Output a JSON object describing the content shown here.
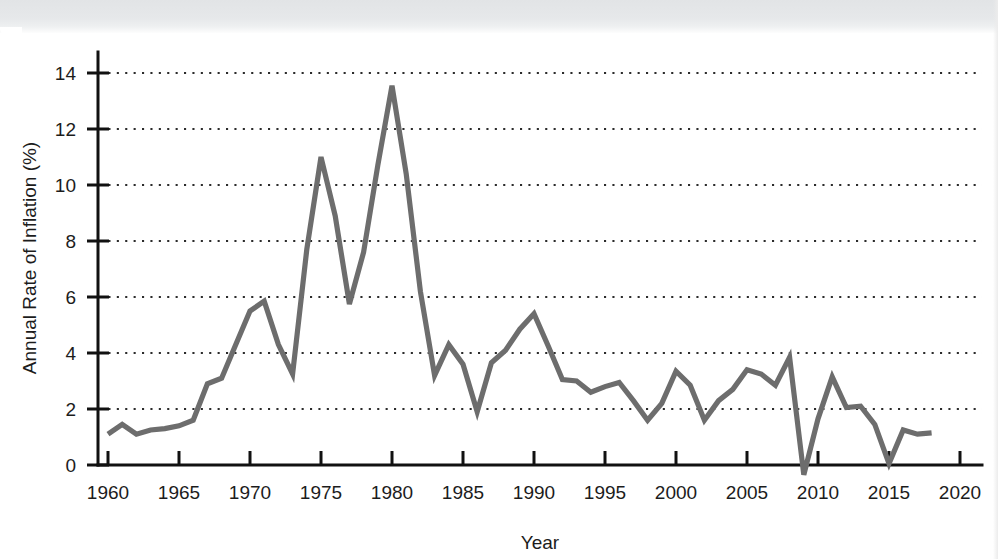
{
  "figure": {
    "background_color": "#ffffff",
    "line_color": "#6d6d6d",
    "axis_color": "#111111",
    "gridline_color": "#2b2b2b"
  },
  "axes": {
    "x_axis_title": "Year",
    "y_axis_title": "Annual Rate of Inflation (%)",
    "x_tick_labels": [
      "1960",
      "1965",
      "1970",
      "1975",
      "1980",
      "1985",
      "1990",
      "1995",
      "2000",
      "2005",
      "2010",
      "2015",
      "2020"
    ],
    "y_tick_labels": [
      "0",
      "2",
      "4",
      "6",
      "8",
      "10",
      "12",
      "14"
    ]
  },
  "chart_data": {
    "type": "line",
    "title": "",
    "subtitle": "",
    "xlabel": "Year",
    "ylabel": "Annual Rate of Inflation (%)",
    "xlim": [
      1958.5,
      2021
    ],
    "ylim": [
      -0.6,
      14.9
    ],
    "x_ticks": [
      1960,
      1965,
      1970,
      1975,
      1980,
      1985,
      1990,
      1995,
      2000,
      2005,
      2010,
      2015,
      2020
    ],
    "y_ticks": [
      0,
      2,
      4,
      6,
      8,
      10,
      12,
      14
    ],
    "grid": "horizontal-dotted",
    "legend": "none",
    "annotations": [],
    "series": [
      {
        "name": "Annual Rate of Inflation (%)",
        "color": "#6d6d6d",
        "x": [
          1960,
          1961,
          1962,
          1963,
          1964,
          1965,
          1966,
          1967,
          1968,
          1969,
          1970,
          1971,
          1972,
          1973,
          1974,
          1975,
          1976,
          1977,
          1978,
          1979,
          1980,
          1981,
          1982,
          1983,
          1984,
          1985,
          1986,
          1987,
          1988,
          1989,
          1990,
          1991,
          1992,
          1993,
          1994,
          1995,
          1996,
          1997,
          1998,
          1999,
          2000,
          2001,
          2002,
          2003,
          2004,
          2005,
          2006,
          2007,
          2008,
          2009,
          2010,
          2011,
          2012,
          2013,
          2014,
          2015,
          2016,
          2017,
          2018
        ],
        "values": [
          1.1,
          1.45,
          1.1,
          1.25,
          1.3,
          1.4,
          1.6,
          2.9,
          3.1,
          4.3,
          5.5,
          5.85,
          4.3,
          3.25,
          7.7,
          11.0,
          8.9,
          5.75,
          7.6,
          10.7,
          13.55,
          10.4,
          6.2,
          3.2,
          4.3,
          3.6,
          1.9,
          3.65,
          4.1,
          4.85,
          5.4,
          4.25,
          3.05,
          3.0,
          2.6,
          2.8,
          2.95,
          2.3,
          1.6,
          2.2,
          3.35,
          2.85,
          1.6,
          2.3,
          2.7,
          3.4,
          3.25,
          2.85,
          3.85,
          -0.35,
          1.65,
          3.15,
          2.05,
          2.1,
          1.45,
          0.05,
          1.25,
          1.1,
          1.15
        ]
      }
    ]
  }
}
